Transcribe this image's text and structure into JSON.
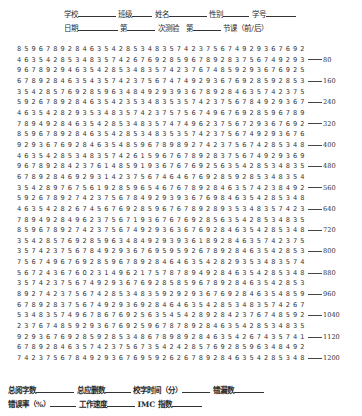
{
  "header": {
    "line1": [
      "学校",
      "班级",
      "姓名",
      "性别",
      "学号"
    ],
    "line2": [
      "日期",
      "第",
      "次测验",
      "第",
      "节课（前/后）"
    ]
  },
  "rows": [
    "8596789284635428534835742375674929367692",
    "4635428534835742676928596789283756749293",
    "9678929463542853483574237674859293676925",
    "6789284635435742375674749293676928592853",
    "3542857692859634849293936789284635742375",
    "5926789284635423534835357423756784929367",
    "4635428293534835742375756749676928596789",
    "7894928463542853483574749623756729367692",
    "8596789284635428534835357423756749293676",
    "9293676928463548596789892742375674285348",
    "4635428534835742615967678928375674929369",
    "9678928423761485919367676925635428534835",
    "6789284692931423756746467692859285348354",
    "3542897675619285965467678928463574238492",
    "5926789274237567849293936769846354285348",
    "4635428267456769285967678928935348357423",
    "7894928496237567193676769285635428534835",
    "8596789274237567492936367692846354285348",
    "3542857692859634849293936189284635742375",
    "3574237567849293676959592678928463542853",
    "7567496769285967892846463542829353483574",
    "5672436760231496217578789492846354285348",
    "3574237567492936769285859678928463542853",
    "8927423756742853483592929367692846354859",
    "6789283756749293692846463542853483574267",
    "5348357496786769256354542892842376748592",
    "2376748592936769259678789284635428534835",
    "9293676928592853486789892846354267435741",
    "6789284635742375673542428576928596348492",
    "7423756784929367695926267892846354285348"
  ],
  "markers": {
    "1": "80",
    "3": "160",
    "5": "240",
    "7": "320",
    "9": "400",
    "11": "480",
    "13": "560",
    "15": "640",
    "17": "720",
    "19": "800",
    "21": "880",
    "23": "960",
    "25": "1040",
    "27": "1120",
    "29": "1200"
  },
  "footer": {
    "line1": [
      "总阅字数",
      "总应删数",
      "校字时间（分）",
      "错漏数"
    ],
    "line2": [
      "错误率（%）",
      "工作速度",
      "IMC 指数"
    ]
  }
}
